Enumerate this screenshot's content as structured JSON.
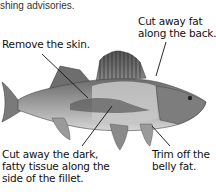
{
  "header": {
    "partial_text": "shing advisories."
  },
  "diagram": {
    "labels": [
      {
        "id": "back",
        "text": "Cut away fat along the back."
      },
      {
        "id": "skin",
        "text": "Remove the skin."
      },
      {
        "id": "dark_tissue",
        "text": "Cut away the dark, fatty tissue along the side of the fillet."
      },
      {
        "id": "belly",
        "text": "Trim off the belly fat."
      }
    ]
  }
}
